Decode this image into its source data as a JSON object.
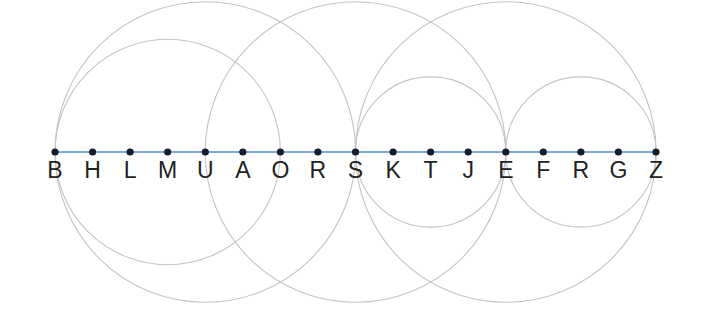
{
  "diagram": {
    "type": "points-on-line-with-circles",
    "line": {
      "x1": 55,
      "x2": 656,
      "y": 152,
      "color": "#4a8fd6"
    },
    "point_color": "#151c2c",
    "circle_color": "#c4c4c4",
    "points": [
      {
        "label": "B",
        "x": 55
      },
      {
        "label": "H",
        "x": 92.6
      },
      {
        "label": "L",
        "x": 130.1
      },
      {
        "label": "M",
        "x": 167.7
      },
      {
        "label": "U",
        "x": 205.3
      },
      {
        "label": "A",
        "x": 242.8
      },
      {
        "label": "O",
        "x": 280.4
      },
      {
        "label": "R",
        "x": 317.9
      },
      {
        "label": "S",
        "x": 355.5
      },
      {
        "label": "K",
        "x": 393.1
      },
      {
        "label": "T",
        "x": 430.6
      },
      {
        "label": "J",
        "x": 468.2
      },
      {
        "label": "E",
        "x": 505.8
      },
      {
        "label": "F",
        "x": 543.3
      },
      {
        "label": "R",
        "x": 580.9
      },
      {
        "label": "G",
        "x": 618.4
      },
      {
        "label": "Z",
        "x": 656
      }
    ],
    "circles": [
      {
        "name": "circle-b-s",
        "from": "B",
        "to": "S",
        "cx": 205.3,
        "r": 150.3
      },
      {
        "name": "circle-b-o",
        "from": "B",
        "to": "O",
        "cx": 167.7,
        "r": 112.7
      },
      {
        "name": "circle-u-e",
        "from": "U",
        "to": "E",
        "cx": 355.5,
        "r": 150.3
      },
      {
        "name": "circle-s-z",
        "from": "S",
        "to": "Z",
        "cx": 505.8,
        "r": 150.3
      },
      {
        "name": "circle-s-e",
        "from": "S",
        "to": "E",
        "cx": 430.6,
        "r": 75.1
      },
      {
        "name": "circle-e-z",
        "from": "E",
        "to": "Z",
        "cx": 580.9,
        "r": 75.1
      }
    ]
  }
}
